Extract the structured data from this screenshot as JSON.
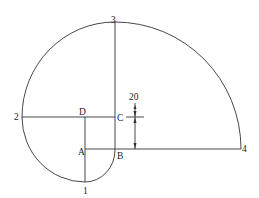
{
  "diagram": {
    "type": "spiral-construction",
    "labels": {
      "point1": "1",
      "point2": "2",
      "point3": "3",
      "point4": "4",
      "A": "A",
      "B": "B",
      "C": "C",
      "D": "D",
      "dimension": "20"
    },
    "stroke_color": "#333333"
  }
}
